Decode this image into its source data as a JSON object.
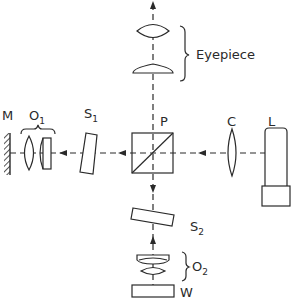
{
  "diagram": {
    "labels": {
      "mirror": "M",
      "objective1": {
        "base": "O",
        "sub": "1"
      },
      "shutter1": {
        "base": "S",
        "sub": "1"
      },
      "prism": "P",
      "condenser": "C",
      "lamp": "L",
      "eyepiece": "Eyepiece",
      "shutter2": {
        "base": "S",
        "sub": "2"
      },
      "objective2": {
        "base": "O",
        "sub": "2"
      },
      "workpiece": "W"
    },
    "colors": {
      "line": "#2a2a2a",
      "background": "#ffffff"
    },
    "components": [
      "mirror",
      "objective-1",
      "plate-s1",
      "beam-splitter-p",
      "condenser-lens-c",
      "lamp-l",
      "eyepiece-lenses",
      "plate-s2",
      "objective-2",
      "workpiece-w"
    ]
  }
}
